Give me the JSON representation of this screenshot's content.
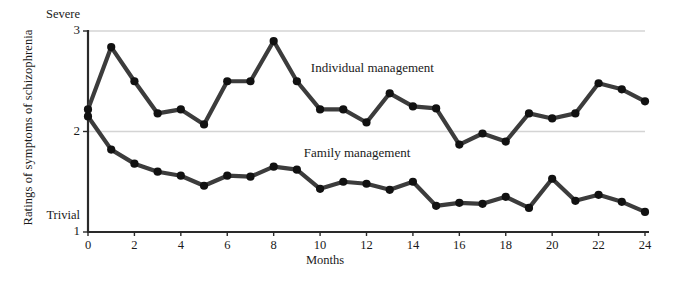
{
  "chart_data": {
    "type": "line",
    "title": "",
    "xlabel": "Months",
    "ylabel": "Ratings of symptoms of schizophrenia",
    "xlim": [
      0,
      24
    ],
    "ylim": [
      1,
      3
    ],
    "grid": "horizontal gridlines at y = 2 and y = 3",
    "legend_position": "inline annotations on plot",
    "y_axis_ticks": [
      {
        "value": 1,
        "label": "1",
        "word": "Trivial"
      },
      {
        "value": 2,
        "label": "2",
        "word": ""
      },
      {
        "value": 3,
        "label": "3",
        "word": "Severe"
      }
    ],
    "x_axis_ticks": [
      {
        "value": 0,
        "label": "0"
      },
      {
        "value": 2,
        "label": "2"
      },
      {
        "value": 4,
        "label": "4"
      },
      {
        "value": 6,
        "label": "6"
      },
      {
        "value": 8,
        "label": "8"
      },
      {
        "value": 10,
        "label": "10"
      },
      {
        "value": 12,
        "label": "12"
      },
      {
        "value": 14,
        "label": "14"
      },
      {
        "value": 16,
        "label": "16"
      },
      {
        "value": 18,
        "label": "18"
      },
      {
        "value": 20,
        "label": "20"
      },
      {
        "value": 22,
        "label": "22"
      },
      {
        "value": 24,
        "label": "24"
      }
    ],
    "x": [
      0,
      1,
      2,
      3,
      4,
      5,
      6,
      7,
      8,
      9,
      10,
      11,
      12,
      13,
      14,
      15,
      16,
      17,
      18,
      19,
      20,
      21,
      22,
      23,
      24
    ],
    "series": [
      {
        "name": "Individual management",
        "color": "#3c3c3c",
        "annotation": "Individual management",
        "annotation_x": 9.6,
        "annotation_y": 2.62,
        "values": [
          2.22,
          2.84,
          2.5,
          2.18,
          2.22,
          2.07,
          2.5,
          2.5,
          2.9,
          2.5,
          2.22,
          2.22,
          2.09,
          2.38,
          2.25,
          2.23,
          1.87,
          1.98,
          1.9,
          2.18,
          2.13,
          2.18,
          2.48,
          2.42,
          2.3
        ]
      },
      {
        "name": "Family management",
        "color": "#3c3c3c",
        "annotation": "Family management",
        "annotation_x": 9.3,
        "annotation_y": 1.78,
        "values": [
          2.15,
          1.82,
          1.68,
          1.6,
          1.56,
          1.46,
          1.56,
          1.55,
          1.65,
          1.62,
          1.43,
          1.5,
          1.48,
          1.42,
          1.5,
          1.26,
          1.29,
          1.28,
          1.35,
          1.24,
          1.53,
          1.31,
          1.37,
          1.3,
          1.2
        ]
      }
    ]
  }
}
